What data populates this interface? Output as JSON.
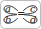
{
  "diagram": {
    "labels": {
      "top_left": "a",
      "bottom_left": "b",
      "top_right": "c",
      "bottom_right": "d"
    },
    "center_symbol": "=",
    "colors": {
      "stroke": "#333333",
      "background": "#ffffff"
    }
  }
}
